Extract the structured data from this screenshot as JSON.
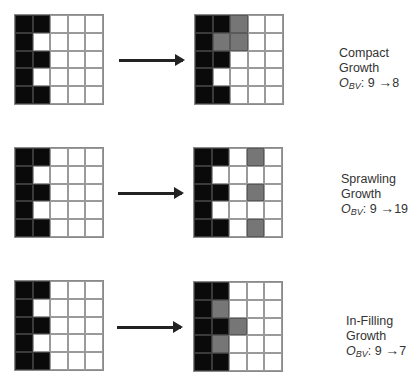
{
  "legend": {
    "black": "#0a0a0a",
    "gray": "#767676",
    "white": "#ffffff"
  },
  "rows": [
    {
      "name": "compact",
      "before": [
        "BBWWW",
        "BWWWW",
        "BBWWW",
        "BWWWW",
        "BBWWW"
      ],
      "after": [
        "BBGWW",
        "BGGWW",
        "BBWWW",
        "BWWWW",
        "BBWWW"
      ],
      "title_line1": "Compact",
      "title_line2": "Growth",
      "metric_symbol": "O",
      "metric_sub": "BV",
      "metric_from": "9",
      "metric_arrow": "→",
      "metric_to": "8"
    },
    {
      "name": "sprawling",
      "before": [
        "BBWWW",
        "BWWWW",
        "BBWWW",
        "BWWWW",
        "BBWWW"
      ],
      "after": [
        "BBWGW",
        "BWWWW",
        "BBWGW",
        "BWWWW",
        "BBWGW"
      ],
      "title_line1": "Sprawling",
      "title_line2": "Growth",
      "metric_symbol": "O",
      "metric_sub": "BV",
      "metric_from": "9",
      "metric_arrow": "→",
      "metric_to": "19"
    },
    {
      "name": "in-filling",
      "before": [
        "BBWWW",
        "BWWWW",
        "BBWWW",
        "BWWWW",
        "BBWWW"
      ],
      "after": [
        "BBWWW",
        "BGWWW",
        "BBGWW",
        "BGWWW",
        "BBWWW"
      ],
      "title_line1": "In-Filling",
      "title_line2": "Growth",
      "metric_symbol": "O",
      "metric_sub": "BV",
      "metric_from": "9",
      "metric_arrow": "→",
      "metric_to": "7"
    }
  ]
}
